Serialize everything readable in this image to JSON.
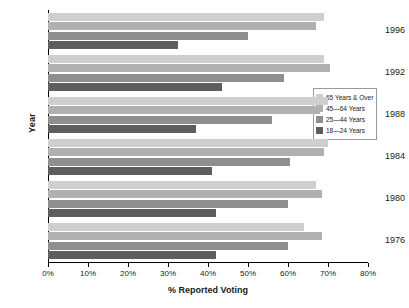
{
  "chart_data": {
    "type": "bar",
    "orientation": "horizontal",
    "title": "",
    "xlabel": "% Reported Voting",
    "ylabel": "Year",
    "xlim": [
      0,
      80
    ],
    "xticks": [
      0,
      10,
      20,
      30,
      40,
      50,
      60,
      70,
      80
    ],
    "xtick_labels": [
      "0%",
      "10%",
      "20%",
      "30%",
      "40%",
      "50%",
      "60%",
      "70%",
      "80%"
    ],
    "categories": [
      "1996",
      "1992",
      "1988",
      "1984",
      "1980",
      "1976"
    ],
    "grid": false,
    "legend_position": "right",
    "series": [
      {
        "name": "65 Years & Over",
        "color": "#cfcfcf",
        "values": [
          69.0,
          69.0,
          70.0,
          70.0,
          67.0,
          64.0
        ]
      },
      {
        "name": "45—64 Years",
        "color": "#b0b0b0",
        "values": [
          67.0,
          70.5,
          68.0,
          69.0,
          68.5,
          68.5
        ]
      },
      {
        "name": "25—44 Years",
        "color": "#8f8f8f",
        "values": [
          50.0,
          59.0,
          56.0,
          60.5,
          60.0,
          60.0
        ]
      },
      {
        "name": "18—24 Years",
        "color": "#5e5e5e",
        "values": [
          32.5,
          43.5,
          37.0,
          41.0,
          42.0,
          42.0
        ]
      }
    ]
  },
  "legend": {
    "items": [
      {
        "label": "65 Years & Over",
        "color": "#cfcfcf"
      },
      {
        "label": "45—64 Years",
        "color": "#b0b0b0"
      },
      {
        "label": "25—44 Years",
        "color": "#8f8f8f"
      },
      {
        "label": "18—24 Years",
        "color": "#5e5e5e"
      }
    ]
  }
}
